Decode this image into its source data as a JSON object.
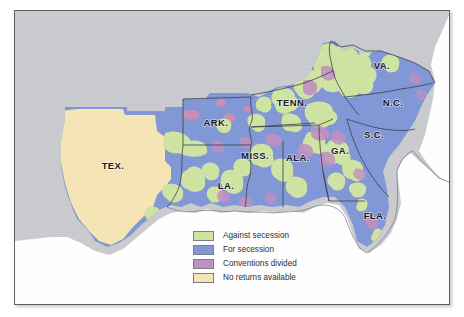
{
  "figure": {
    "kind": "historical-thematic-map",
    "plate_background": "#c9cbce",
    "border_color": "#5c5f66"
  },
  "map": {
    "ocean_color": "#ffffff",
    "outside_color": "#c9cbce",
    "state_border_color": "#3b3d45",
    "coast_border_color": "#6f7480",
    "labels": [
      {
        "id": "tex",
        "text": "TEX.",
        "x": 98,
        "y": 158
      },
      {
        "id": "ark",
        "text": "ARK.",
        "x": 201,
        "y": 115
      },
      {
        "id": "la",
        "text": "LA.",
        "x": 211,
        "y": 178
      },
      {
        "id": "miss",
        "text": "MISS.",
        "x": 240,
        "y": 148
      },
      {
        "id": "ala",
        "text": "ALA.",
        "x": 280,
        "y": 150
      },
      {
        "id": "tenn",
        "text": "TENN.",
        "x": 277,
        "y": 94
      },
      {
        "id": "ga",
        "text": "GA.",
        "x": 325,
        "y": 143
      },
      {
        "id": "fla",
        "text": "FLA.",
        "x": 360,
        "y": 208
      },
      {
        "id": "sc",
        "text": "S.C.",
        "x": 359,
        "y": 127
      },
      {
        "id": "nc",
        "text": "N.C.",
        "x": 378,
        "y": 95
      },
      {
        "id": "va",
        "text": "VA.",
        "x": 367,
        "y": 58
      }
    ]
  },
  "colors": {
    "against_secession": "#cfe3a3",
    "for_secession": "#8196d6",
    "conventions_divided": "#c18fc0",
    "no_returns_available": "#f6e5b5"
  },
  "legend": {
    "items": [
      {
        "label": "Against secession",
        "color_key": "against_secession"
      },
      {
        "label": "For secession",
        "color_key": "for_secession"
      },
      {
        "label": "Conventions divided",
        "color_key": "conventions_divided"
      },
      {
        "label": "No returns available",
        "color_key": "no_returns_available"
      }
    ]
  }
}
